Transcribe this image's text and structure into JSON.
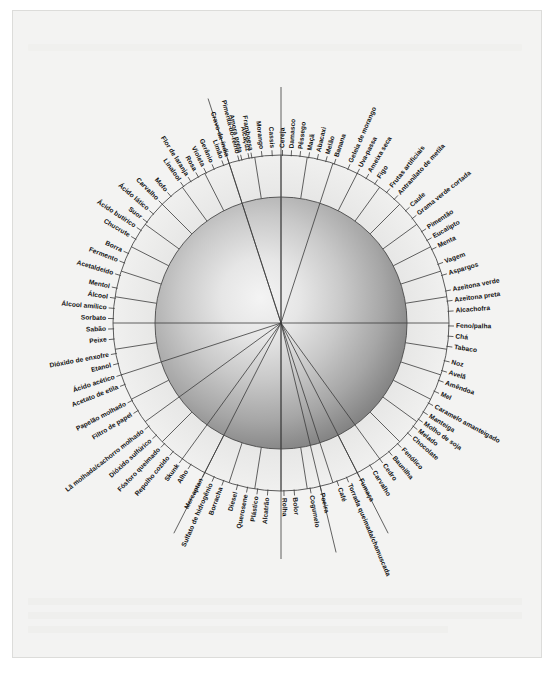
{
  "figure": {
    "kind": "aroma-wheel",
    "language": "pt-BR",
    "center": {
      "x": 281,
      "y": 323
    },
    "radii": {
      "sphere": 126,
      "inner_ring": 126,
      "outer_ring": 168,
      "label_base": 172
    },
    "colors": {
      "page_background": "#ffffff",
      "paper": "#f3f3f2",
      "paper_border": "#dcdcda",
      "line": "#3b3b3b",
      "ring_line": "#4a4a4a",
      "label_text": "#111111",
      "sphere_highlight": "#f2f2f2",
      "sphere_mid": "#b9b9b9",
      "sphere_edge": "#6e6e6e"
    }
  },
  "chart_data": {
    "type": "pie",
    "xlabel": "",
    "ylabel": "",
    "legend_position": "none",
    "grid": false,
    "note": "Radial aroma wheel: each label is a descriptor placed around the rim; sectors are separated by radial spoke lines converging on the centre.",
    "categories": [
      "Alcaçuz",
      "Pimenta-do-reino",
      "Cravo-da-índia",
      "Gerânio",
      "Violeta",
      "Rosa",
      "Flor de laranja",
      "Linalool",
      "Mofo",
      "Carvalho",
      "Ácido lático",
      "Suor",
      "Ácido butírico",
      "Chucrute",
      "Borra",
      "Fermento",
      "Acetaldeído",
      "Mentol",
      "Álcool",
      "Álcool amílico",
      "Sorbato",
      "Sabão",
      "Peixe",
      "Dióxido de enxofre",
      "Etanol",
      "Ácido acético",
      "Acetato de etila",
      "Papelão molhado",
      "Filtro de papel",
      "Lã molhada/cachorro molhado",
      "Dióxido sulfúrico",
      "Fósforo queimado",
      "Repolho cozido",
      "Skunk",
      "Alho",
      "Mercaptan",
      "Sulfato de hidrogênio",
      "Borracha",
      "Diesel",
      "Querosene",
      "Plástico",
      "Alcatrão",
      "Rolha",
      "Bolor",
      "Cogumelo",
      "Poeira",
      "Café",
      "Torrada queimada/chamuscada",
      "Fumaça",
      "Carvalho",
      "Cedro",
      "Baunilha",
      "Fenólico",
      "Chocolate",
      "Melado",
      "Molho de soja",
      "Manteiga",
      "Caramelo amanteigado",
      "Mel",
      "Amêndoa",
      "Avelã",
      "Noz",
      "Tabaco",
      "Chá",
      "Feno/palha",
      "Alcachofra",
      "Azeitona preta",
      "Azeitona verde",
      "Aspargos",
      "Vagem",
      "Menta",
      "Eucalipto",
      "Pimentão",
      "Grama verde cortada",
      "Caule",
      "Antranilato de metila",
      "Frutas artificiais",
      "Figo",
      "Ameixa seca",
      "Uva-passa",
      "Geleia de morango",
      "Banana",
      "Melão",
      "Abacaxi",
      "Maçã",
      "Pêssego",
      "Damasco",
      "Cereja",
      "Cassis",
      "Morango",
      "Framboesa",
      "Amora preta",
      "Limão"
    ],
    "values": [
      1,
      1,
      1,
      1,
      1,
      1,
      1,
      1,
      1,
      1,
      1,
      1,
      1,
      1,
      1,
      1,
      1,
      1,
      1,
      1,
      1,
      1,
      1,
      1,
      1,
      1,
      1,
      1,
      1,
      1,
      1,
      1,
      1,
      1,
      1,
      1,
      1,
      1,
      1,
      1,
      1,
      1,
      1,
      1,
      1,
      1,
      1,
      1,
      1,
      1,
      1,
      1,
      1,
      1,
      1,
      1,
      1,
      1,
      1,
      1,
      1,
      1,
      1,
      1,
      1,
      1,
      1,
      1,
      1,
      1,
      1,
      1,
      1,
      1,
      1,
      1,
      1,
      1,
      1,
      1,
      1,
      1,
      1,
      1,
      1,
      1,
      1,
      1,
      1,
      1,
      1,
      1,
      1
    ]
  },
  "wheel": {
    "labels": [
      {
        "text": "Alcaçuz",
        "angle": -101.0,
        "lead": 0
      },
      {
        "text": "Pimenta-do-reino",
        "angle": -104.5,
        "lead": 0
      },
      {
        "text": "Cravo-da-índia",
        "angle": -108.0,
        "lead": 0
      },
      {
        "text": "Gerânio",
        "angle": -113.5,
        "lead": 0
      },
      {
        "text": "Violeta",
        "angle": -116.5,
        "lead": 0
      },
      {
        "text": "Rosa",
        "angle": -119.5,
        "lead": 0
      },
      {
        "text": "Flor de laranja",
        "angle": -122.5,
        "lead": 0
      },
      {
        "text": "Linalool",
        "angle": -125.5,
        "lead": 0
      },
      {
        "text": "Mofo",
        "angle": -131.0,
        "lead": 0
      },
      {
        "text": "Carvalho",
        "angle": -135.0,
        "lead": 0
      },
      {
        "text": "Ácido lático",
        "angle": -139.5,
        "lead": 0
      },
      {
        "text": "Suor",
        "angle": -143.0,
        "lead": 0
      },
      {
        "text": "Ácido butírico",
        "angle": -146.5,
        "lead": 0
      },
      {
        "text": "Chucrute",
        "angle": -150.0,
        "lead": 0
      },
      {
        "text": "Borra",
        "angle": -155.5,
        "lead": 0
      },
      {
        "text": "Fermento",
        "angle": -159.0,
        "lead": 0
      },
      {
        "text": "Acetaldeído",
        "angle": -163.5,
        "lead": 0
      },
      {
        "text": "Mentol",
        "angle": -168.0,
        "lead": 0
      },
      {
        "text": "Álcool",
        "angle": -171.5,
        "lead": 0
      },
      {
        "text": "Álcool amílico",
        "angle": -175.0,
        "lead": 0
      },
      {
        "text": "Sorbato",
        "angle": -178.5,
        "lead": 0
      },
      {
        "text": "Sabão",
        "angle": 178.0,
        "lead": 0
      },
      {
        "text": "Peixe",
        "angle": 174.5,
        "lead": 0
      },
      {
        "text": "Dióxido de enxofre",
        "angle": 169.5,
        "lead": 0
      },
      {
        "text": "Etanol",
        "angle": 166.0,
        "lead": 0
      },
      {
        "text": "Ácido acético",
        "angle": 162.0,
        "lead": 0
      },
      {
        "text": "Acetato de etila",
        "angle": 158.5,
        "lead": 0
      },
      {
        "text": "Papelão molhado",
        "angle": 152.5,
        "lead": 0
      },
      {
        "text": "Filtro de papel",
        "angle": 148.5,
        "lead": 0
      },
      {
        "text": "Lã molhada/cachorro molhado",
        "angle": 142.0,
        "lead": 0
      },
      {
        "text": "Dióxido sulfúrico",
        "angle": 138.0,
        "lead": 0
      },
      {
        "text": "Fósforo queimado",
        "angle": 134.0,
        "lead": 0
      },
      {
        "text": "Repolho cozido",
        "angle": 130.0,
        "lead": 0
      },
      {
        "text": "Skunk",
        "angle": 126.0,
        "lead": 0
      },
      {
        "text": "Alho",
        "angle": 122.5,
        "lead": 0
      },
      {
        "text": "Mercaptan",
        "angle": 117.0,
        "lead": 0
      },
      {
        "text": "Sulfato de hidrogênio",
        "angle": 113.5,
        "lead": 0
      },
      {
        "text": "Borracha",
        "angle": 110.0,
        "lead": 0
      },
      {
        "text": "Diesel",
        "angle": 105.0,
        "lead": 0
      },
      {
        "text": "Querosene",
        "angle": 101.5,
        "lead": 0
      },
      {
        "text": "Plástico",
        "angle": 98.0,
        "lead": 0
      },
      {
        "text": "Alcatrão",
        "angle": 94.5,
        "lead": 0
      },
      {
        "text": "Rolha",
        "angle": 89.0,
        "lead": 0
      },
      {
        "text": "Bolor",
        "angle": 85.5,
        "lead": 0
      },
      {
        "text": "Cogumelo",
        "angle": 80.0,
        "lead": 0
      },
      {
        "text": "Poeira",
        "angle": 76.5,
        "lead": 0
      },
      {
        "text": "Café",
        "angle": 70.5,
        "lead": 0
      },
      {
        "text": "Torrada queimada/chamuscada",
        "angle": 67.0,
        "lead": 0
      },
      {
        "text": "Fumaça",
        "angle": 63.0,
        "lead": 0
      },
      {
        "text": "Carvalho",
        "angle": 58.0,
        "lead": 0
      },
      {
        "text": "Cedro",
        "angle": 54.0,
        "lead": 0
      },
      {
        "text": "Baunilha",
        "angle": 50.0,
        "lead": 0
      },
      {
        "text": "Fenólico",
        "angle": 46.0,
        "lead": 0
      },
      {
        "text": "Chocolate",
        "angle": 41.0,
        "lead": 0
      },
      {
        "text": "Melado",
        "angle": 38.0,
        "lead": 0
      },
      {
        "text": "Molho de soja",
        "angle": 35.0,
        "lead": 0
      },
      {
        "text": "Manteiga",
        "angle": 32.0,
        "lead": 0
      },
      {
        "text": "Caramelo amanteigado",
        "angle": 28.5,
        "lead": 0
      },
      {
        "text": "Mel",
        "angle": 24.0,
        "lead": 0
      },
      {
        "text": "Amêndoa",
        "angle": 20.0,
        "lead": 0
      },
      {
        "text": "Avelã",
        "angle": 16.5,
        "lead": 0
      },
      {
        "text": "Noz",
        "angle": 13.0,
        "lead": 0
      },
      {
        "text": "Tabaco",
        "angle": 8.0,
        "lead": 0
      },
      {
        "text": "Chá",
        "angle": 4.5,
        "lead": 0
      },
      {
        "text": "Feno/palha",
        "angle": 1.0,
        "lead": 0
      },
      {
        "text": "Alcachofra",
        "angle": -4.0,
        "lead": 0
      },
      {
        "text": "Azeitona preta",
        "angle": -7.5,
        "lead": 0
      },
      {
        "text": "Azeitona verde",
        "angle": -11.0,
        "lead": 0
      },
      {
        "text": "Aspargos",
        "angle": -16.5,
        "lead": 0
      },
      {
        "text": "Vagem",
        "angle": -20.5,
        "lead": 0
      },
      {
        "text": "Menta",
        "angle": -26.0,
        "lead": 0
      },
      {
        "text": "Eucalipto",
        "angle": -29.5,
        "lead": 0
      },
      {
        "text": "Pimentão",
        "angle": -33.0,
        "lead": 0
      },
      {
        "text": "Grama verde cortada",
        "angle": -38.5,
        "lead": 0
      },
      {
        "text": "Caule",
        "angle": -42.0,
        "lead": 0
      },
      {
        "text": "Antranilato de metila",
        "angle": -47.5,
        "lead": 0
      },
      {
        "text": "Frutas artificiais",
        "angle": -51.0,
        "lead": 0
      },
      {
        "text": "Figo",
        "angle": -56.0,
        "lead": 0
      },
      {
        "text": "Ameixa seca",
        "angle": -59.5,
        "lead": 0
      },
      {
        "text": "Uva-passa",
        "angle": -63.0,
        "lead": 0
      },
      {
        "text": "Geleia de morango",
        "angle": -66.5,
        "lead": 0
      },
      {
        "text": "Banana",
        "angle": -71.5,
        "lead": 0
      },
      {
        "text": "Melão",
        "angle": -74.5,
        "lead": 0
      },
      {
        "text": "Abacaxi",
        "angle": -77.5,
        "lead": 0
      },
      {
        "text": "Maçã",
        "angle": -80.5,
        "lead": 0
      },
      {
        "text": "Pêssego",
        "angle": -83.5,
        "lead": 0
      },
      {
        "text": "Damasco",
        "angle": -86.5,
        "lead": 0
      },
      {
        "text": "Cereja",
        "angle": -89.5,
        "lead": 0
      },
      {
        "text": "Cassis",
        "angle": -93.0,
        "lead": 0
      },
      {
        "text": "Morango",
        "angle": -96.5,
        "lead": 0
      },
      {
        "text": "Framboesa",
        "angle": -100.0,
        "lead": 0
      },
      {
        "text": "Amora preta",
        "angle": -103.5,
        "lead": 0
      },
      {
        "text": "Limão",
        "angle": -110.0,
        "lead": 0
      }
    ],
    "spokes": [
      -90,
      -81,
      -72,
      -63,
      -54,
      -45,
      -36,
      -27,
      -18,
      -9,
      0,
      9,
      18,
      27,
      36,
      45,
      54,
      63,
      72,
      81,
      90,
      99,
      108,
      117,
      126,
      135,
      144,
      153,
      162,
      171,
      180,
      -171,
      -162,
      -153,
      -144,
      -135,
      -126,
      -117,
      -108,
      -99
    ],
    "long_spokes": [
      -90,
      90,
      180,
      0,
      -108,
      -72,
      54,
      72,
      126,
      144,
      162
    ]
  }
}
